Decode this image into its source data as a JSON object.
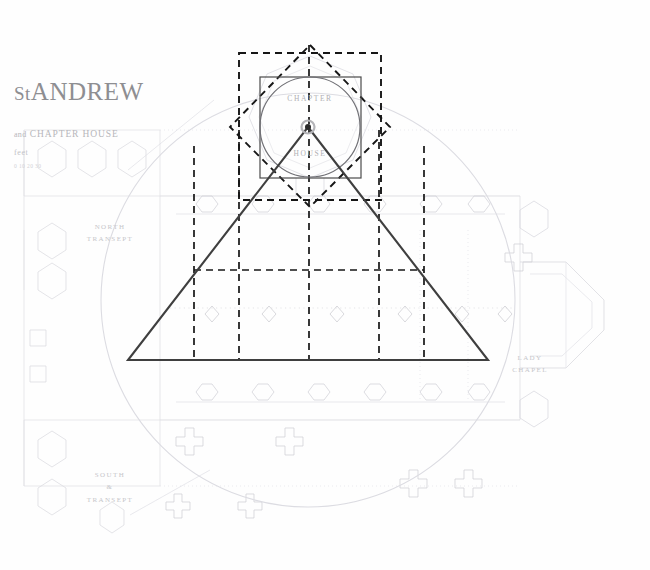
{
  "sheet": {
    "background_color": "#fefefe",
    "border_color": "#c9c9c9"
  },
  "title_block": {
    "title": "St ANDREW",
    "title_lead": "St",
    "title_rest": "ANDREW",
    "subtitle_lead": "and",
    "subtitle": "CHAPTER HOUSE",
    "scale_label": "feet",
    "scale_note": "0   10   20   30"
  },
  "geometry_labels": {
    "chapter": "CHAPTER",
    "house": "HOUSE"
  },
  "plan_labels": [
    {
      "name": "north-transept",
      "lines": [
        "NORTH",
        "TRANSEPT"
      ],
      "x": 110,
      "y": 221
    },
    {
      "name": "south-transept",
      "lines": [
        "SOUTH",
        "&",
        "TRANSEPT"
      ],
      "x": 110,
      "y": 469
    },
    {
      "name": "lady-chapel",
      "lines": [
        "LADY",
        "CHAPEL"
      ],
      "x": 530,
      "y": 352
    }
  ],
  "colors": {
    "plan_line": "#c9c9ce",
    "plan_line_faint": "#dedee3",
    "construction_solid": "#3a3a3a",
    "construction_dashed": "#1c1c1c",
    "circle_main": "#6d6d72",
    "circle_big_faint": "#dcdce2",
    "center_marker": "#2a2a2a",
    "center_halo": "#aaaaae"
  },
  "construction": {
    "apex": {
      "x": 308,
      "y": 127
    },
    "triangle": {
      "left_x": 128,
      "right_x": 488,
      "base_y": 360
    },
    "outer_dashed_square": {
      "x": 239,
      "y": 53,
      "w": 142,
      "h": 147
    },
    "inner_solid_square": {
      "x": 260,
      "y": 77,
      "w": 101,
      "h": 101
    },
    "chapter_circle": {
      "cx": 310,
      "cy": 127,
      "r": 50
    },
    "diamond_vertices": [
      [
        310,
        45
      ],
      [
        390,
        127
      ],
      [
        310,
        207
      ],
      [
        230,
        127
      ]
    ],
    "big_faint_circle": {
      "cx": 308,
      "cy": 300,
      "r": 207
    },
    "nave_grid_vertical_x": [
      194,
      239,
      309,
      379,
      424
    ],
    "nave_grid_horizontal_y": 270,
    "center_vertical_x": 309
  }
}
